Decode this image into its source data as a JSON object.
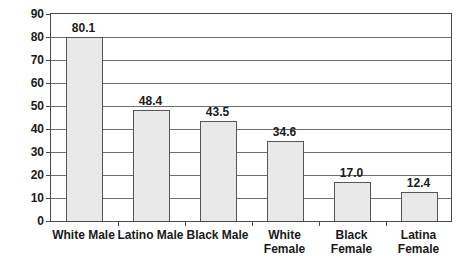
{
  "chart_data": {
    "type": "bar",
    "title": "",
    "xlabel": "",
    "ylabel": "Percentage",
    "ylim": [
      0,
      90
    ],
    "yticks": [
      0,
      10,
      20,
      30,
      40,
      50,
      60,
      70,
      80,
      90
    ],
    "ytick_labels": [
      "0",
      "10",
      "20",
      "30",
      "40",
      "50",
      "60",
      "70",
      "80",
      "90"
    ],
    "grid": true,
    "legend": "none",
    "categories": [
      "White Male",
      "Latino Male",
      "Black Male",
      "White\nFemale",
      "Black\nFemale",
      "Latina\nFemale"
    ],
    "values": [
      80.1,
      48.4,
      43.5,
      34.6,
      17.0,
      12.4
    ],
    "value_labels": [
      "80.1",
      "48.4",
      "43.5",
      "34.6",
      "17.0",
      "12.4"
    ],
    "bar_fill_color": "#e9e9e9",
    "bar_edge_color": "#555555",
    "axis_color": "#4a4a4a",
    "grid_color": "#6e6e6e",
    "background_color": "#ffffff"
  }
}
